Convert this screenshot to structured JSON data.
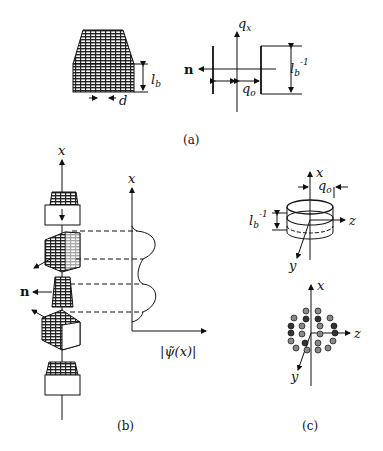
{
  "figure": {
    "panels": [
      {
        "id": "a",
        "caption": "(a)",
        "left": {
          "description": "layered lattice block",
          "height_label": "l",
          "height_label_sub": "b",
          "spacing_label": "d"
        },
        "right": {
          "description": "reciprocal-space schematic",
          "axis_label": "q",
          "axis_label_sub": "x",
          "normal_label": "n",
          "offset_label": "q",
          "offset_label_sub": "o",
          "width_label": "l",
          "width_label_sub": "b",
          "width_label_sup": "-1"
        }
      },
      {
        "id": "b",
        "caption": "(b)",
        "axis_label": "x",
        "plot_axis_label": "x",
        "normal_label": "n",
        "function_label": "|ψ̃(x)|"
      },
      {
        "id": "c",
        "caption": "(c)",
        "top": {
          "axis_x": "x",
          "axis_y": "y",
          "axis_z": "z",
          "offset_label": "q",
          "offset_label_sub": "o",
          "height_label": "l",
          "height_label_sub": "b",
          "height_label_sup": "-1"
        },
        "bottom": {
          "axis_x": "x",
          "axis_y": "y",
          "axis_z": "z"
        }
      }
    ]
  }
}
